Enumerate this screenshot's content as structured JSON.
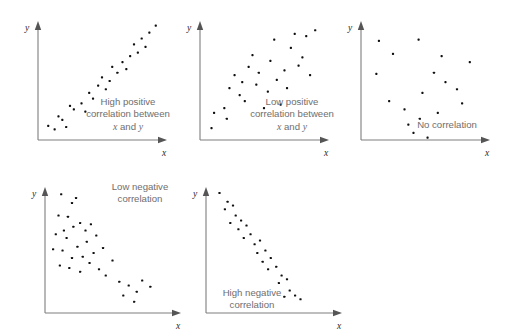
{
  "figure": {
    "title": "",
    "background_color": "#ffffff",
    "point_color": "#101010",
    "axis_color": "#7e7e7e",
    "caption_color": "#6e6e6e",
    "axis_label_color": "#2b2b2b",
    "width": 511,
    "height": 333
  },
  "chart_data": {
    "type": "scatter",
    "xlabel": "x",
    "ylabel": "y",
    "grid": false,
    "legend": "none",
    "xlim": [
      0,
      100
    ],
    "ylim": [
      0,
      100
    ],
    "panels": [
      {
        "id": "high-positive",
        "caption_lines": [
          "High positive",
          "correlation between",
          "x and y"
        ],
        "caption_line1": "High positive",
        "caption_line2": "correlation between",
        "caption_line3_pre": "x",
        "caption_line3_mid": " and ",
        "caption_line3_post": "y",
        "xlabel": "x",
        "ylabel": "y",
        "points": [
          [
            8,
            12
          ],
          [
            13,
            9
          ],
          [
            16,
            20
          ],
          [
            19,
            17
          ],
          [
            22,
            11
          ],
          [
            25,
            29
          ],
          [
            28,
            26
          ],
          [
            34,
            31
          ],
          [
            37,
            24
          ],
          [
            40,
            40
          ],
          [
            43,
            35
          ],
          [
            47,
            46
          ],
          [
            50,
            53
          ],
          [
            53,
            43
          ],
          [
            56,
            50
          ],
          [
            58,
            62
          ],
          [
            62,
            57
          ],
          [
            66,
            66
          ],
          [
            69,
            60
          ],
          [
            72,
            71
          ],
          [
            75,
            81
          ],
          [
            78,
            74
          ],
          [
            81,
            86
          ],
          [
            84,
            79
          ],
          [
            87,
            91
          ],
          [
            92,
            97
          ]
        ]
      },
      {
        "id": "low-positive",
        "caption_lines": [
          "Low positive",
          "correlation between",
          "x and y"
        ],
        "caption_line1": "Low positive",
        "caption_line2": "correlation between",
        "caption_line3_pre": "x",
        "caption_line3_mid": " and ",
        "caption_line3_post": "y",
        "xlabel": "x",
        "ylabel": "y",
        "points": [
          [
            9,
            10
          ],
          [
            11,
            23
          ],
          [
            19,
            27
          ],
          [
            21,
            18
          ],
          [
            23,
            44
          ],
          [
            27,
            55
          ],
          [
            31,
            38
          ],
          [
            33,
            49
          ],
          [
            35,
            33
          ],
          [
            38,
            62
          ],
          [
            41,
            72
          ],
          [
            44,
            47
          ],
          [
            46,
            57
          ],
          [
            50,
            27
          ],
          [
            53,
            41
          ],
          [
            55,
            67
          ],
          [
            58,
            85
          ],
          [
            60,
            51
          ],
          [
            63,
            30
          ],
          [
            66,
            59
          ],
          [
            68,
            44
          ],
          [
            71,
            78
          ],
          [
            74,
            90
          ],
          [
            77,
            63
          ],
          [
            80,
            70
          ],
          [
            83,
            88
          ],
          [
            86,
            55
          ],
          [
            90,
            93
          ]
        ]
      },
      {
        "id": "no-correlation",
        "caption_lines": [
          "No correlation"
        ],
        "caption_line1": "No correlation",
        "xlabel": "x",
        "ylabel": "y",
        "points": [
          [
            14,
            84
          ],
          [
            25,
            73
          ],
          [
            12,
            56
          ],
          [
            22,
            33
          ],
          [
            34,
            26
          ],
          [
            37,
            13
          ],
          [
            41,
            6
          ],
          [
            48,
            40
          ],
          [
            46,
            18
          ],
          [
            45,
            85
          ],
          [
            57,
            57
          ],
          [
            60,
            23
          ],
          [
            63,
            71
          ],
          [
            66,
            49
          ],
          [
            75,
            43
          ],
          [
            79,
            31
          ],
          [
            85,
            66
          ],
          [
            52,
            2
          ]
        ]
      },
      {
        "id": "low-negative",
        "caption_lines": [
          "Low negative",
          "correlation"
        ],
        "caption_line1": "Low negative",
        "caption_line2": "correlation",
        "xlabel": "x",
        "ylabel": "y",
        "points": [
          [
            12,
            95
          ],
          [
            20,
            88
          ],
          [
            10,
            78
          ],
          [
            17,
            77
          ],
          [
            23,
            92
          ],
          [
            14,
            66
          ],
          [
            21,
            69
          ],
          [
            8,
            63
          ],
          [
            16,
            60
          ],
          [
            26,
            72
          ],
          [
            30,
            66
          ],
          [
            34,
            71
          ],
          [
            6,
            51
          ],
          [
            13,
            50
          ],
          [
            24,
            53
          ],
          [
            31,
            57
          ],
          [
            38,
            62
          ],
          [
            20,
            44
          ],
          [
            28,
            45
          ],
          [
            36,
            48
          ],
          [
            43,
            52
          ],
          [
            11,
            38
          ],
          [
            18,
            36
          ],
          [
            26,
            33
          ],
          [
            33,
            40
          ],
          [
            40,
            35
          ],
          [
            45,
            30
          ],
          [
            50,
            42
          ],
          [
            55,
            25
          ],
          [
            62,
            22
          ],
          [
            58,
            14
          ],
          [
            68,
            17
          ],
          [
            72,
            26
          ],
          [
            78,
            21
          ],
          [
            66,
            9
          ]
        ]
      },
      {
        "id": "high-negative",
        "caption_lines": [
          "High negative",
          "correlation"
        ],
        "caption_line1": "High negative",
        "caption_line2": "correlation",
        "xlabel": "x",
        "ylabel": "y",
        "points": [
          [
            10,
            96
          ],
          [
            16,
            89
          ],
          [
            14,
            83
          ],
          [
            20,
            86
          ],
          [
            22,
            78
          ],
          [
            18,
            72
          ],
          [
            26,
            74
          ],
          [
            24,
            67
          ],
          [
            30,
            70
          ],
          [
            28,
            60
          ],
          [
            33,
            63
          ],
          [
            36,
            55
          ],
          [
            40,
            58
          ],
          [
            38,
            48
          ],
          [
            44,
            50
          ],
          [
            42,
            41
          ],
          [
            48,
            44
          ],
          [
            46,
            35
          ],
          [
            52,
            37
          ],
          [
            56,
            30
          ],
          [
            54,
            24
          ],
          [
            60,
            27
          ],
          [
            62,
            18
          ],
          [
            58,
            13
          ],
          [
            66,
            14
          ],
          [
            70,
            11
          ]
        ]
      }
    ]
  }
}
